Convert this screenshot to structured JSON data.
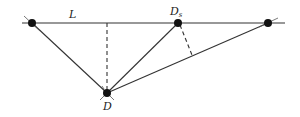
{
  "diagram": {
    "labels": {
      "line": "L",
      "point_d": "D",
      "point_ds_main": "D",
      "point_ds_sub": "s"
    },
    "colors": {
      "ink": "#111111",
      "line": "#333333",
      "background": "#ffffff"
    }
  }
}
